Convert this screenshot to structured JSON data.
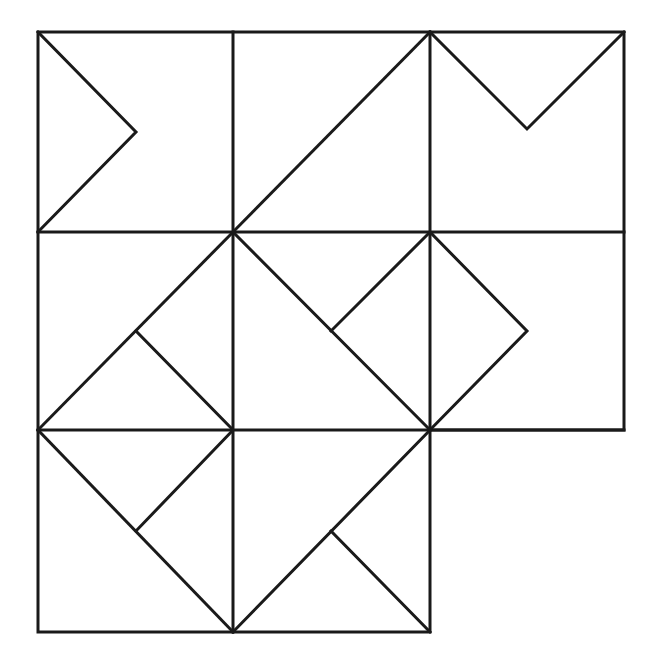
{
  "figure": {
    "background_color": "#ffffff",
    "stroke_color": "#1a1a1a",
    "stroke_width": 3,
    "canvas": {
      "width": 656,
      "height": 665
    },
    "grid": {
      "columns_x": [
        38,
        233,
        430,
        624
      ],
      "rows_y": [
        32,
        232,
        430,
        632
      ],
      "cell_count": 8,
      "missing_cell": "row-3-col-3"
    },
    "outline": {
      "name": "outer-boundary",
      "points": "38,32 624,32 624,430 430,430 430,632 38,632 38,32"
    },
    "grid_lines": [
      {
        "name": "vertical-line-1",
        "x1": 233,
        "y1": 32,
        "x2": 233,
        "y2": 632
      },
      {
        "name": "vertical-line-2",
        "x1": 430,
        "y1": 32,
        "x2": 430,
        "y2": 430
      },
      {
        "name": "horizontal-line-1",
        "x1": 38,
        "y1": 232,
        "x2": 624,
        "y2": 232
      },
      {
        "name": "horizontal-line-2",
        "x1": 38,
        "y1": 430,
        "x2": 624,
        "y2": 430
      }
    ],
    "cells": [
      {
        "name": "cell-row1-col1",
        "motif": "right-chevron",
        "label": "Chevron pointing right",
        "polyline": "38,32 136,132 38,232"
      },
      {
        "name": "cell-row1-col2",
        "motif": "anti-diagonal",
        "label": "Diagonal from bottom-left to top-right",
        "polyline": "233,232 430,32"
      },
      {
        "name": "cell-row1-col3",
        "motif": "down-chevron",
        "label": "Chevron pointing down",
        "polyline": "430,32 527,129 624,32"
      },
      {
        "name": "cell-row2-col1",
        "motif": "anti-diagonal-with-branch",
        "label": "Diagonal bottom-left to top-right with branch to bottom-right corner",
        "polyline": "38,430 233,232",
        "branch": "136,331 233,430"
      },
      {
        "name": "cell-row2-col2",
        "motif": "main-diagonal-with-branch",
        "label": "Diagonal top-left to bottom-right with branch to top-right corner",
        "polyline": "233,232 430,430",
        "branch": "331,331 430,232"
      },
      {
        "name": "cell-row2-col3",
        "motif": "right-chevron",
        "label": "Chevron pointing right",
        "polyline": "430,232 527,331 430,430"
      },
      {
        "name": "cell-row3-col1",
        "motif": "main-diagonal-with-branch",
        "label": "Diagonal top-left to bottom-right with branch to top-right corner",
        "polyline": "38,430 233,632",
        "branch": "136,531 233,430"
      },
      {
        "name": "cell-row3-col2",
        "motif": "anti-diagonal-with-branch",
        "label": "Diagonal bottom-left to top-right with branch to bottom-right corner",
        "polyline": "233,632 430,430",
        "branch": "331,531 430,632"
      }
    ]
  }
}
